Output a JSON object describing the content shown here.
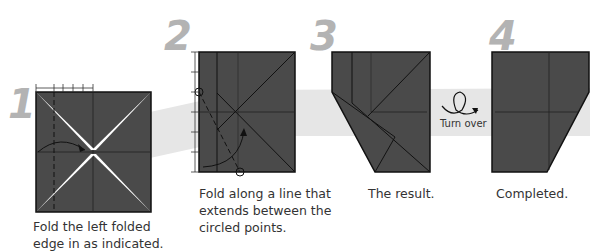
{
  "steps": [
    {
      "number": "1",
      "caption_line1": "Fold the left folded",
      "caption_line2": "edge in as indicated."
    },
    {
      "number": "2",
      "caption_line1": "Fold along a line that",
      "caption_line2": "extends between the",
      "caption_line3": "circled points."
    },
    {
      "number": "3",
      "caption_line1": "The result."
    },
    {
      "number": "4",
      "caption_line1": "Completed."
    }
  ],
  "turn_over": {
    "label": "Turn over",
    "icon": "turn-over-icon"
  },
  "colors": {
    "paper": "#4a4a4a",
    "band": "#e6e6e6",
    "number": "#b3b3b3",
    "line": "#1a1a1a"
  }
}
